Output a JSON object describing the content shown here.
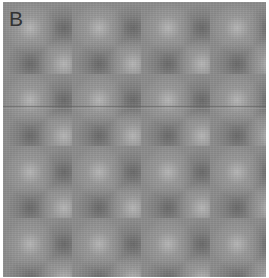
{
  "figure": {
    "panel_label": "B",
    "colors": {
      "background": "#8c8c8c",
      "light_spot": "#bebebe",
      "dark_spot": "#5f5f5f",
      "label": "#333333",
      "border": "#ffffff"
    }
  }
}
